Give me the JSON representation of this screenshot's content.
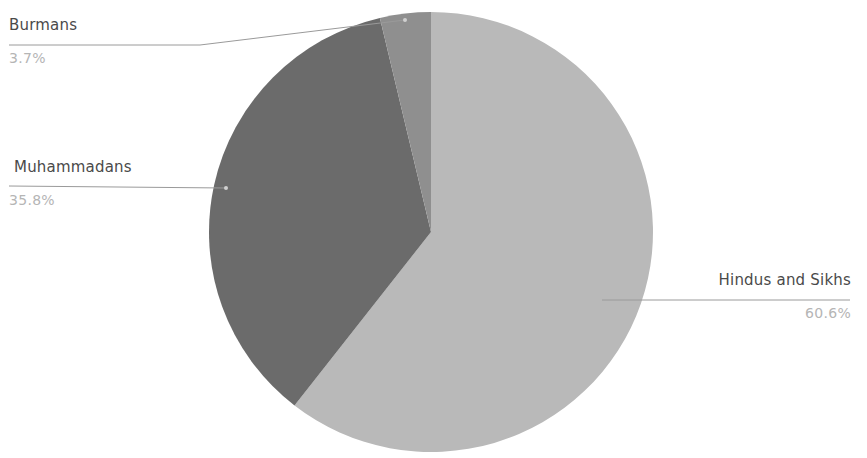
{
  "chart_data": {
    "type": "pie",
    "title": "",
    "categories": [
      "Hindus and Sikhs",
      "Muhammadans",
      "Burmans"
    ],
    "values": [
      60.6,
      35.8,
      3.7
    ],
    "unit": "%",
    "colors": [
      "#b9b9b9",
      "#6b6b6b",
      "#8f8f8f"
    ],
    "start_angle_deg": 0,
    "direction": "clockwise",
    "labels": [
      {
        "name": "Hindus and Sikhs",
        "percent": "60.6%"
      },
      {
        "name": "Muhammadans",
        "percent": "35.8%"
      },
      {
        "name": "Burmans",
        "percent": "3.7%"
      }
    ],
    "legend": "none (outside data labels with leader lines)"
  },
  "labels": {
    "burmans": {
      "name": "Burmans",
      "percent": "3.7%"
    },
    "muhammadans": {
      "name": "Muhammadans",
      "percent": "35.8%"
    },
    "hindus": {
      "name": "Hindus and Sikhs",
      "percent": "60.6%"
    }
  },
  "style": {
    "leader_color": "#9a9a9a"
  }
}
